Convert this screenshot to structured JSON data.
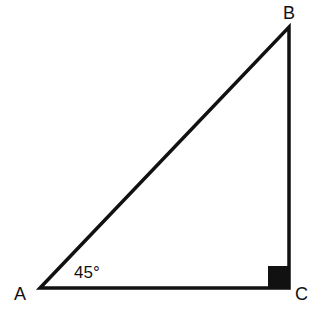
{
  "diagram": {
    "type": "right-triangle",
    "vertices": {
      "A": {
        "label": "A",
        "x": 40,
        "y": 288
      },
      "B": {
        "label": "B",
        "x": 289,
        "y": 27
      },
      "C": {
        "label": "C",
        "x": 289,
        "y": 288
      }
    },
    "angle_label": "45°",
    "right_angle_at": "C",
    "stroke_color": "#111111"
  }
}
